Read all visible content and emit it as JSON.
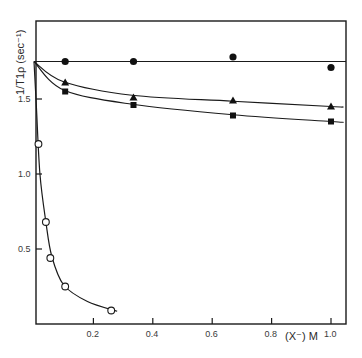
{
  "chart_data": {
    "type": "scatter",
    "title": "",
    "xlabel": "(X⁻) M",
    "ylabel": "1/T1ρ (sec⁻¹)",
    "xlim": [
      0,
      1.02
    ],
    "ylim": [
      0,
      2.0
    ],
    "x_ticks": [
      {
        "value": 0.2,
        "label": "0.2"
      },
      {
        "value": 0.4,
        "label": "0.4"
      },
      {
        "value": 0.6,
        "label": "0.6"
      },
      {
        "value": 0.8,
        "label": "0.8"
      },
      {
        "value": 1.0,
        "label": "1.0"
      }
    ],
    "y_ticks": [
      {
        "value": 0.5,
        "label": "0.5"
      },
      {
        "value": 1.0,
        "label": "1.0"
      },
      {
        "value": 1.5,
        "label": "1.5"
      }
    ],
    "grid": false,
    "legend": null,
    "series": [
      {
        "name": "filled-circle",
        "marker": "filled-circle",
        "x": [
          0.0,
          0.105,
          0.335,
          0.67,
          1.0
        ],
        "y": [
          1.75,
          1.75,
          1.75,
          1.78,
          1.71
        ],
        "fit": "horizontal line at 1.75"
      },
      {
        "name": "filled-triangle",
        "marker": "filled-triangle",
        "x": [
          0.0,
          0.105,
          0.335,
          0.67,
          1.0
        ],
        "y": [
          1.75,
          1.61,
          1.51,
          1.49,
          1.45
        ]
      },
      {
        "name": "filled-square",
        "marker": "filled-square",
        "x": [
          0.0,
          0.105,
          0.335,
          0.67,
          1.0
        ],
        "y": [
          1.75,
          1.55,
          1.46,
          1.39,
          1.35
        ]
      },
      {
        "name": "open-circle",
        "marker": "open-circle",
        "x": [
          0.0,
          0.015,
          0.04,
          0.055,
          0.105,
          0.26
        ],
        "y": [
          1.75,
          1.2,
          0.68,
          0.44,
          0.25,
          0.09
        ]
      }
    ]
  }
}
